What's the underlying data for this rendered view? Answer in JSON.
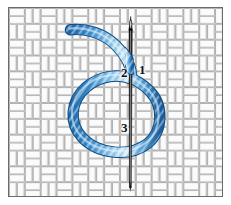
{
  "diagram": {
    "background": {
      "name": "basket-weave fabric",
      "weave_color": "#ffffff",
      "weave_line_color": "#9a9a9a",
      "weave_shadow_color": "#c9c9c9",
      "cell_size_px": 16
    },
    "frame": {
      "border_color": "#6b6b6b",
      "inner_border_color": "#d8d8d8",
      "page_background": "#ffffff"
    },
    "needle": {
      "name": "sewing-needle",
      "color": "#111111",
      "highlight_color": "#6e6e6e",
      "tip_label": "point",
      "eye_label": "eye"
    },
    "thread": {
      "name": "embroidery-thread",
      "color_dark": "#2f7fc4",
      "color_mid": "#5ea9dd",
      "color_light": "#cfe8f7",
      "outline_color": "#17568f",
      "description": "twisted blue floss forming a loop around the needle"
    },
    "labels": [
      {
        "id": "1",
        "text": "1",
        "meaning": "needle entry point"
      },
      {
        "id": "2",
        "text": "2",
        "meaning": "thread crosses behind needle"
      },
      {
        "id": "3",
        "text": "3",
        "meaning": "loop passes under needle tip"
      }
    ]
  }
}
